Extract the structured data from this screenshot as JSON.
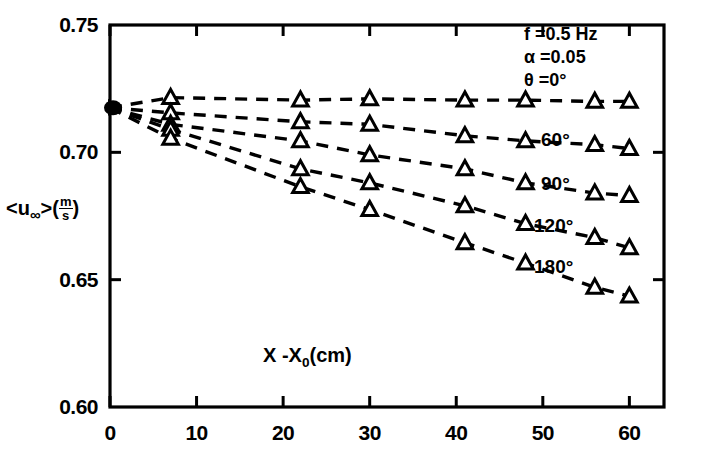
{
  "chart_data": {
    "type": "line",
    "title": "",
    "xlabel": "X - X0(cm)",
    "ylabel": "<u∞>(m/s)",
    "xlim": [
      0,
      64
    ],
    "ylim": [
      0.6,
      0.75
    ],
    "xticks": [
      0,
      10,
      20,
      30,
      40,
      50,
      60
    ],
    "xticklabels": [
      "0",
      "10",
      "20",
      "30",
      "40",
      "50",
      "60"
    ],
    "yticks": [
      0.6,
      0.65,
      0.7,
      0.75
    ],
    "yticklabels": [
      "0.60",
      "0.65",
      "0.70",
      "0.75"
    ],
    "grid": false,
    "legend_position": "inline-right-of-curves",
    "marker": "triangle-up-open",
    "linestyle": "dashed",
    "annotations": [
      "f = 0.5 Hz",
      "α = 0.05"
    ],
    "annotation_parts": {
      "frequency_symbol": "f",
      "frequency_value": "0.5 Hz",
      "amplitude_symbol": "α",
      "amplitude_value": "0.05",
      "theta_symbol": "θ",
      "theta_value": "0°"
    },
    "series": [
      {
        "name": "θ = 0°",
        "label": "θ = 0°",
        "label_inline": "0°",
        "x": [
          0,
          7,
          22,
          30,
          41,
          48,
          56,
          60
        ],
        "y": [
          0.7175,
          0.7215,
          0.7205,
          0.721,
          0.7205,
          0.7205,
          0.72,
          0.72
        ]
      },
      {
        "name": "60°",
        "label": "60°",
        "label_inline": "60°",
        "x": [
          0,
          7,
          22,
          30,
          41,
          48,
          56,
          60
        ],
        "y": [
          0.7175,
          0.7155,
          0.712,
          0.711,
          0.7065,
          0.7045,
          0.703,
          0.7015
        ]
      },
      {
        "name": "90°",
        "label": "90°",
        "label_inline": "90°",
        "x": [
          0,
          7,
          22,
          30,
          41,
          48,
          56,
          60
        ],
        "y": [
          0.7175,
          0.711,
          0.7045,
          0.699,
          0.6935,
          0.688,
          0.684,
          0.683
        ]
      },
      {
        "name": "120°",
        "label": "120°",
        "label_inline": "120°",
        "x": [
          0,
          7,
          22,
          30,
          41,
          48,
          56,
          60
        ],
        "y": [
          0.7175,
          0.709,
          0.6935,
          0.688,
          0.679,
          0.672,
          0.6665,
          0.6625
        ]
      },
      {
        "name": "180°",
        "label": "180°",
        "label_inline": "180°",
        "x": [
          0,
          7,
          22,
          30,
          41,
          48,
          56,
          60
        ],
        "y": [
          0.7175,
          0.7055,
          0.6865,
          0.6775,
          0.6645,
          0.6565,
          0.647,
          0.6435
        ]
      }
    ]
  },
  "axis": {
    "y_tick_labels": [
      "0.75",
      "0.70",
      "0.65",
      "0.60"
    ],
    "x_tick_labels": [
      "0",
      "10",
      "20",
      "30",
      "40",
      "50",
      "60"
    ],
    "y_axis_title_main": "<u",
    "y_axis_title_inf": "∞",
    "y_axis_title_close": ">(",
    "y_axis_title_num": "m",
    "y_axis_title_den": "s",
    "y_axis_title_end": ")",
    "x_axis_title_x": "X -",
    "x_axis_title_x0": "X",
    "x_axis_title_sub": "0",
    "x_axis_title_unit": "(cm)"
  },
  "annotations": {
    "line1_sym": "f",
    "line1_eq": "=",
    "line1_val": "0.5 Hz",
    "line2_sym": "α",
    "line2_eq": "=",
    "line2_val": "0.05",
    "line3_sym": "θ",
    "line3_eq": "=",
    "line3_val": "0°"
  },
  "series_labels": {
    "s0": "0°",
    "s1": "60°",
    "s2": "90°",
    "s3": "120°",
    "s4": "180°"
  },
  "colors": {
    "ink": "#000000",
    "background": "#ffffff"
  }
}
